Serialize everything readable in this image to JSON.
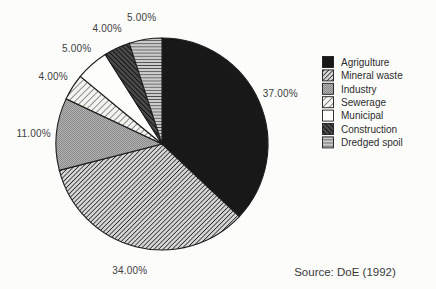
{
  "figure": {
    "background": "#fcfcfb",
    "source_note": "Source: DoE (1992)"
  },
  "chart_data": {
    "type": "pie",
    "title": "",
    "unit": "%",
    "direction": "clockwise",
    "start_angle_deg": 0,
    "legend_position": "right",
    "categories": [
      "Agrigulture",
      "Mineral waste",
      "Industry",
      "Sewerage",
      "Municipal",
      "Construction",
      "Dredged spoil"
    ],
    "values": [
      37,
      34,
      11,
      4,
      5,
      4,
      5
    ],
    "slice_labels": [
      "37.00%",
      "34.00%",
      "11.00%",
      "4.00%",
      "5.00%",
      "4.00%",
      "5.00%"
    ],
    "patterns": [
      "solid-black",
      "hatch-dense",
      "halftone-gray",
      "hatch-light",
      "plain-white",
      "hatch-dark",
      "hstripe-gray"
    ]
  },
  "legend": {
    "items": [
      {
        "label": "Agrigulture",
        "pattern": "solid-black"
      },
      {
        "label": "Mineral waste",
        "pattern": "hatch-dense"
      },
      {
        "label": "Industry",
        "pattern": "halftone-gray"
      },
      {
        "label": "Sewerage",
        "pattern": "hatch-light"
      },
      {
        "label": "Municipal",
        "pattern": "plain-white"
      },
      {
        "label": "Construction",
        "pattern": "hatch-dark"
      },
      {
        "label": "Dredged spoil",
        "pattern": "hstripe-gray"
      }
    ]
  },
  "colors": {
    "ink": "#1c1c1c",
    "slice_black": "#181818",
    "slice_white": "#fdfdfc",
    "gray_halftone": "#a8a8a8",
    "stripe_gray": "#cbcbcb",
    "dark_hatch_bg": "#4a4a4a"
  }
}
